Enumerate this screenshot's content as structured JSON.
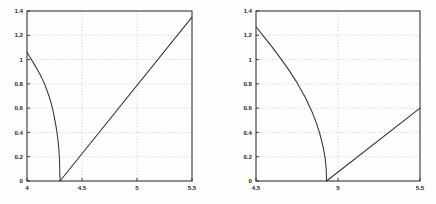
{
  "figure": {
    "background": "#fefefe",
    "axis_color": "#2b2b2b",
    "curve_color": "#333333",
    "grid_color": "#9a9a9a"
  },
  "chart_data": [
    {
      "type": "line",
      "title": "",
      "xlabel": "",
      "ylabel": "",
      "xlim": [
        4,
        5.5
      ],
      "ylim": [
        0,
        1.4
      ],
      "grid": true,
      "legend": "none",
      "xticks": [
        4,
        4.5,
        5,
        5.5
      ],
      "xticklabels": [
        "4",
        "4.5",
        "5",
        "5.5"
      ],
      "yticks": [
        0,
        0.2,
        0.4,
        0.6,
        0.8,
        1,
        1.2,
        1.4
      ],
      "yticklabels": [
        "0",
        "0.2",
        "0.4",
        "0.6",
        "0.8",
        "1",
        "1.2",
        "1.4"
      ],
      "root": 4.3,
      "series": [
        {
          "name": "descending-branch",
          "x": [
            4.0,
            4.04,
            4.08,
            4.12,
            4.16,
            4.2,
            4.22,
            4.24,
            4.26,
            4.27,
            4.28,
            4.29,
            4.295,
            4.3
          ],
          "values": [
            1.06,
            1.0,
            0.94,
            0.875,
            0.8,
            0.7,
            0.64,
            0.565,
            0.47,
            0.415,
            0.35,
            0.26,
            0.185,
            0.0
          ]
        },
        {
          "name": "ascending-line",
          "x": [
            4.3,
            5.5
          ],
          "values": [
            0.0,
            1.35
          ]
        }
      ]
    },
    {
      "type": "line",
      "title": "",
      "xlabel": "",
      "ylabel": "",
      "xlim": [
        4.5,
        5.5
      ],
      "ylim": [
        0,
        1.4
      ],
      "grid": true,
      "legend": "none",
      "xticks": [
        4.5,
        5,
        5.5
      ],
      "xticklabels": [
        "4.5",
        "5",
        "5.5"
      ],
      "yticks": [
        0,
        0.2,
        0.4,
        0.6,
        0.8,
        1,
        1.2,
        1.4
      ],
      "yticklabels": [
        "0",
        "0.2",
        "0.4",
        "0.6",
        "0.8",
        "1",
        "1.2",
        "1.4"
      ],
      "root": 4.93,
      "series": [
        {
          "name": "descending-branch",
          "x": [
            4.5,
            4.55,
            4.6,
            4.65,
            4.7,
            4.75,
            4.8,
            4.84,
            4.87,
            4.89,
            4.905,
            4.915,
            4.922,
            4.928,
            4.93
          ],
          "values": [
            1.27,
            1.185,
            1.1,
            1.01,
            0.915,
            0.81,
            0.69,
            0.575,
            0.47,
            0.385,
            0.305,
            0.24,
            0.185,
            0.1,
            0.0
          ]
        },
        {
          "name": "ascending-line",
          "x": [
            4.93,
            5.5
          ],
          "values": [
            0.0,
            0.6
          ]
        }
      ]
    }
  ]
}
